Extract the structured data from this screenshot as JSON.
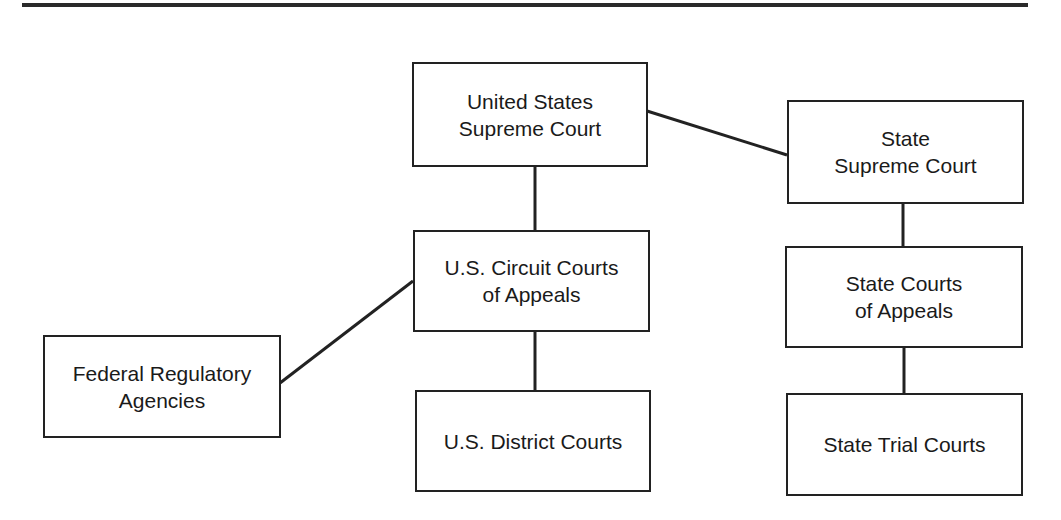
{
  "diagram": {
    "type": "court-hierarchy",
    "nodes": [
      {
        "id": "us_supreme",
        "label": "United States\nSupreme Court"
      },
      {
        "id": "state_supreme",
        "label": "State\nSupreme Court"
      },
      {
        "id": "us_circuit",
        "label": "U.S. Circuit Courts\nof Appeals"
      },
      {
        "id": "state_appeals",
        "label": "State Courts\nof Appeals"
      },
      {
        "id": "federal_reg",
        "label": "Federal Regulatory\nAgencies"
      },
      {
        "id": "us_district",
        "label": "U.S. District Courts"
      },
      {
        "id": "state_trial",
        "label": "State Trial Courts"
      }
    ],
    "edges": [
      {
        "from": "us_supreme",
        "to": "state_supreme"
      },
      {
        "from": "us_supreme",
        "to": "us_circuit"
      },
      {
        "from": "us_circuit",
        "to": "us_district"
      },
      {
        "from": "federal_reg",
        "to": "us_circuit"
      },
      {
        "from": "state_supreme",
        "to": "state_appeals"
      },
      {
        "from": "state_appeals",
        "to": "state_trial"
      }
    ],
    "colors": {
      "line": "#222222",
      "background": "#ffffff"
    }
  }
}
